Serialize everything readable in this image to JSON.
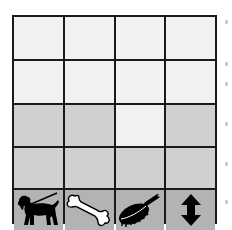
{
  "board": {
    "rows": 5,
    "cols": 4,
    "cells": [
      [
        "light",
        "light",
        "light",
        "light"
      ],
      [
        "light",
        "light",
        "light",
        "light"
      ],
      [
        "gray",
        "gray",
        "light",
        "gray"
      ],
      [
        "gray",
        "gray",
        "gray",
        "gray"
      ],
      [
        "dark",
        "dark",
        "dark",
        "dark"
      ]
    ],
    "colors": {
      "light": "#f1f1f1",
      "gray": "#d0d0d0",
      "dark": "#b3b3b3",
      "border": "#1a1a1a"
    }
  },
  "toolbar": {
    "items": [
      {
        "icon": "dog-on-leash-icon",
        "label": "Walk"
      },
      {
        "icon": "bone-icon",
        "label": "Feed"
      },
      {
        "icon": "brush-icon",
        "label": "Groom"
      },
      {
        "icon": "up-down-arrow-icon",
        "label": "Move"
      }
    ]
  }
}
